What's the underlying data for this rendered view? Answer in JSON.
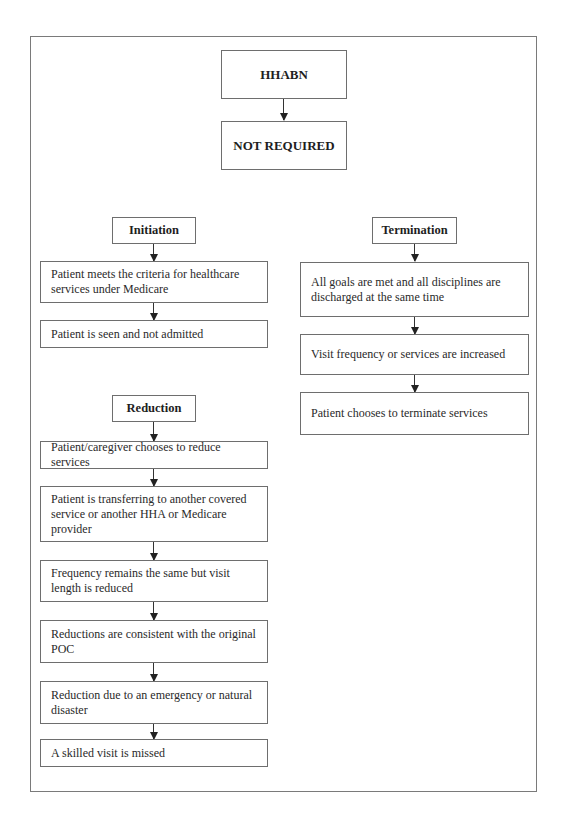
{
  "diagram": {
    "type": "flowchart",
    "root": {
      "title": "HHABN",
      "result": "NOT REQUIRED"
    },
    "sections": {
      "initiation": {
        "header": "Initiation",
        "items": [
          "Patient meets the criteria for healthcare services under Medicare",
          "Patient is seen and not admitted"
        ]
      },
      "termination": {
        "header": "Termination",
        "items": [
          "All goals are met and all disciplines are discharged at the same time",
          "Visit frequency or services are increased",
          "Patient chooses to terminate services"
        ]
      },
      "reduction": {
        "header": "Reduction",
        "items": [
          "Patient/caregiver chooses to reduce services",
          "Patient is transferring to another covered service or another HHA or Medicare provider",
          "Frequency remains the same but visit length is reduced",
          "Reductions are consistent with the original POC",
          "Reduction due to an emergency or natural disaster",
          "A skilled visit is missed"
        ]
      }
    },
    "colors": {
      "border": "#6e6e6e",
      "frame": "#7a7a7a",
      "text": "#222222",
      "background": "#ffffff"
    }
  }
}
